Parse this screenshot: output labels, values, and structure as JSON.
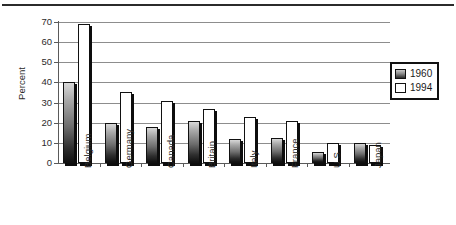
{
  "chart_data": {
    "type": "bar",
    "title": "",
    "subtitle": "",
    "xlabel": "",
    "ylabel": "Percent",
    "ylim": [
      0,
      70
    ],
    "yticks": [
      0,
      10,
      20,
      30,
      40,
      50,
      60,
      70
    ],
    "grid": true,
    "legend_position": "right",
    "categories": [
      "Belgium",
      "Germany",
      "Canada",
      "Britain",
      "Italy",
      "France",
      "U.S.",
      "Japan"
    ],
    "series": [
      {
        "name": "1960",
        "swatch": "gradient-dark",
        "color": "#6d6d6d",
        "values": [
          40,
          20,
          18,
          21,
          12,
          12.5,
          5.5,
          10
        ]
      },
      {
        "name": "1994",
        "swatch": "white",
        "color": "#ffffff",
        "values": [
          69,
          35.5,
          31,
          27,
          23,
          21,
          10,
          9
        ]
      }
    ]
  },
  "legend": {
    "items": [
      {
        "label": "1960"
      },
      {
        "label": "1994"
      }
    ]
  },
  "axis": {
    "y_title": "Percent",
    "y_tick_labels": [
      "70",
      "60",
      "50",
      "40",
      "30",
      "20",
      "10",
      "0"
    ]
  },
  "decorations": {
    "top_rule": true,
    "rule_color": "#2b2b2b"
  }
}
